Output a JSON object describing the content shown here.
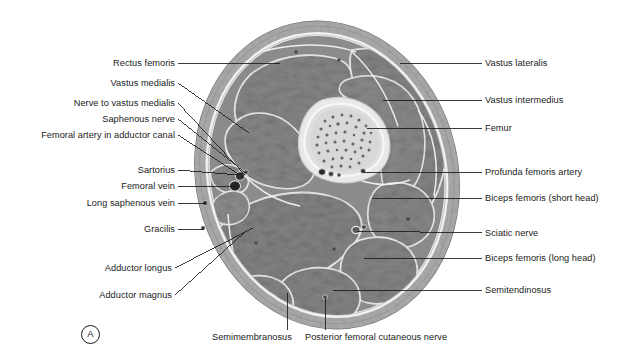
{
  "figure": {
    "panel_letter": "A"
  },
  "labels_left": [
    {
      "text": "Rectus femoris",
      "tx": 175,
      "ty": 63,
      "lx1": 178,
      "ly1": 63,
      "lx2": 280,
      "ly2": 63
    },
    {
      "text": "Vastus medialis",
      "tx": 175,
      "ty": 83,
      "lx1": 178,
      "ly1": 83,
      "lx2": 249,
      "ly2": 133
    },
    {
      "text": "Nerve to vastus medialis",
      "tx": 175,
      "ty": 103,
      "lx1": 178,
      "ly1": 103,
      "lx2": 245,
      "ly2": 175
    },
    {
      "text": "Saphenous nerve",
      "tx": 175,
      "ty": 119,
      "lx1": 178,
      "ly1": 119,
      "lx2": 247,
      "ly2": 174
    },
    {
      "text": "Femoral artery in adductor canal",
      "tx": 175,
      "ty": 135,
      "lx1": 178,
      "ly1": 135,
      "lx2": 243,
      "ly2": 177
    },
    {
      "text": "Sartorius",
      "tx": 175,
      "ty": 170,
      "lx1": 178,
      "ly1": 170,
      "lx2": 239,
      "ly2": 175
    },
    {
      "text": "Femoral vein",
      "tx": 175,
      "ty": 186,
      "lx1": 178,
      "ly1": 186,
      "lx2": 236,
      "ly2": 186
    },
    {
      "text": "Long saphenous vein",
      "tx": 175,
      "ty": 203,
      "lx1": 178,
      "ly1": 203,
      "lx2": 206,
      "ly2": 203
    },
    {
      "text": "Gracilis",
      "tx": 175,
      "ty": 229,
      "lx1": 178,
      "ly1": 229,
      "lx2": 204,
      "ly2": 229
    },
    {
      "text": "Adductor longus",
      "tx": 172,
      "ty": 268,
      "lx1": 175,
      "ly1": 268,
      "lx2": 253,
      "ly2": 228
    },
    {
      "text": "Adductor magnus",
      "tx": 172,
      "ty": 295,
      "lx1": 175,
      "ly1": 295,
      "lx2": 245,
      "ly2": 232
    }
  ],
  "labels_right": [
    {
      "text": "Vastus lateralis",
      "tx": 485,
      "ty": 63,
      "lx1": 482,
      "ly1": 63,
      "lx2": 400,
      "ly2": 63
    },
    {
      "text": "Vastus intermedius",
      "tx": 485,
      "ty": 100,
      "lx1": 482,
      "ly1": 100,
      "lx2": 383,
      "ly2": 100
    },
    {
      "text": "Femur",
      "tx": 485,
      "ty": 128,
      "lx1": 482,
      "ly1": 128,
      "lx2": 367,
      "ly2": 128
    },
    {
      "text": "Profunda femoris artery",
      "tx": 485,
      "ty": 172,
      "lx1": 482,
      "ly1": 172,
      "lx2": 364,
      "ly2": 172
    },
    {
      "text": "Biceps femoris (short head)",
      "tx": 485,
      "ty": 198,
      "lx1": 482,
      "ly1": 198,
      "lx2": 372,
      "ly2": 198
    },
    {
      "text": "Sciatic nerve",
      "tx": 485,
      "ty": 233,
      "lx1": 482,
      "ly1": 233,
      "lx2": 357,
      "ly2": 231
    },
    {
      "text": "Biceps femoris (long head)",
      "tx": 485,
      "ty": 258,
      "lx1": 482,
      "ly1": 258,
      "lx2": 364,
      "ly2": 258
    },
    {
      "text": "Semitendinosus",
      "tx": 485,
      "ty": 290,
      "lx1": 482,
      "ly1": 290,
      "lx2": 333,
      "ly2": 290
    }
  ],
  "labels_bottom": [
    {
      "text": "Semimembranosus",
      "tx": 212,
      "ty": 332,
      "lx1": 287,
      "ly1": 330,
      "lx2": 287,
      "ly2": 293
    },
    {
      "text": "Posterior femoral cutaneous nerve",
      "tx": 305,
      "ty": 332,
      "lx1": 325,
      "ly1": 330,
      "lx2": 325,
      "ly2": 297
    }
  ],
  "colors": {
    "background": "#ffffff",
    "skin_rim": "#b9b9b9",
    "subcutaneous_fat": "#a9a9a9",
    "deep_fascia": "#cfcfcf",
    "muscle": "#8d8d8d",
    "muscle_dark": "#7e7e7e",
    "fascial_line": "#ededed",
    "bone_cortex": "#e6e6e6",
    "bone_marrow": "#dcdcdc",
    "marrow_speckle": "#6e6e6e",
    "vessel_dark": "#3a3a3a",
    "vessel_mid": "#5e5e5e",
    "leader_line": "#1a1a1a",
    "label_text": "#1a1a1a"
  }
}
